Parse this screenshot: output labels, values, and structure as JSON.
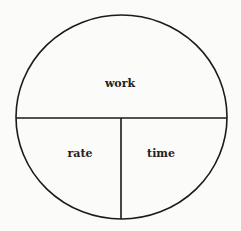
{
  "diagram": {
    "type": "work-rate-time circle",
    "labels": {
      "top": "work",
      "bottom_left": "rate",
      "bottom_right": "time"
    },
    "colors": {
      "stroke": "#1a1a1a",
      "text": "#222222",
      "background": "#fbfbfa"
    }
  }
}
